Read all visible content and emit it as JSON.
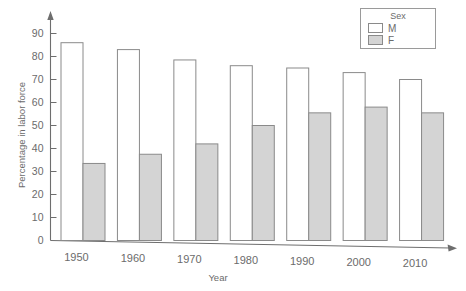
{
  "chart_data": {
    "type": "bar",
    "title": "",
    "xlabel": "Year",
    "ylabel": "Percentage in labor force",
    "categories": [
      "1950",
      "1960",
      "1970",
      "1980",
      "1990",
      "2000",
      "2010"
    ],
    "series": [
      {
        "name": "M",
        "values": [
          86,
          83,
          78.5,
          76,
          75,
          73,
          70
        ]
      },
      {
        "name": "F",
        "values": [
          33.5,
          37.5,
          42,
          50,
          55.5,
          58,
          55.5
        ]
      }
    ],
    "ylim": [
      0,
      95
    ],
    "yticks": [
      0,
      10,
      20,
      30,
      40,
      50,
      60,
      70,
      80,
      90
    ],
    "ytick_labels": [
      "0",
      "10",
      "20",
      "30",
      "40",
      "50",
      "60",
      "70",
      "80",
      "90"
    ],
    "xtick_labels": [
      "1950",
      "1960",
      "1970",
      "1980",
      "1990",
      "2010"
    ],
    "grid": false,
    "legend": {
      "title": "Sex",
      "position": "top-right",
      "entries": [
        {
          "label": "M",
          "color": "#ffffff"
        },
        {
          "label": "F",
          "color": "#d4d4d4"
        }
      ]
    },
    "colors": {
      "male_fill": "#ffffff",
      "female_fill": "#d4d4d4",
      "bar_stroke": "#8a8a8a",
      "axis": "#6e6e6e",
      "text": "#6b6b6b",
      "background": "#ffffff"
    },
    "axis_arrows": {
      "x": true,
      "y": true
    }
  }
}
